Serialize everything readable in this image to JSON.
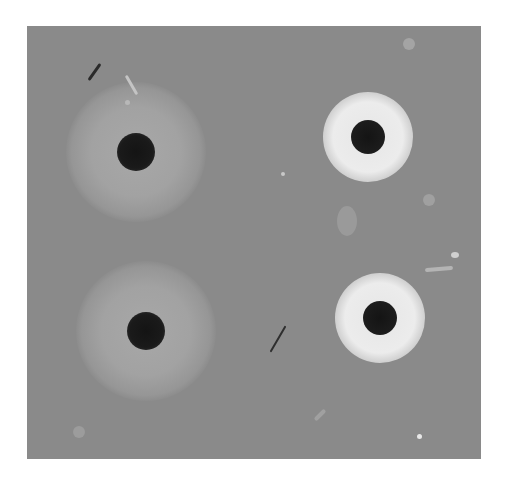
{
  "image": {
    "description": "Grayscale photograph of an agar diffusion plate with four wells; left wells show diffuse light zones, right wells show sharp bright rings",
    "colors": {
      "background": "#8a8a8a",
      "well": "#1a1a1a",
      "diffuse_halo": "#a6a6a6",
      "bright_ring": "#e8e8e8"
    },
    "wells": [
      {
        "id": "top-left",
        "cx": 109,
        "cy": 126,
        "r": 19,
        "zone": "diffuse",
        "zone_r": 62
      },
      {
        "id": "top-right",
        "cx": 341,
        "cy": 111,
        "r": 17,
        "zone": "ring",
        "zone_r": 37
      },
      {
        "id": "bottom-left",
        "cx": 119,
        "cy": 305,
        "r": 19,
        "zone": "diffuse",
        "zone_r": 62
      },
      {
        "id": "bottom-right",
        "cx": 353,
        "cy": 292,
        "r": 17,
        "zone": "ring",
        "zone_r": 37
      }
    ]
  }
}
